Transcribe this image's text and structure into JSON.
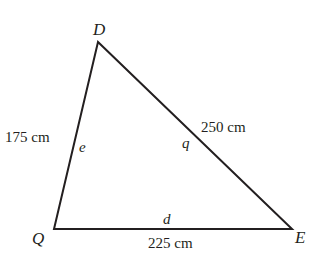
{
  "diagram": {
    "type": "triangle",
    "stroke_color": "#231f20",
    "vertices": {
      "D": {
        "label": "D",
        "x": 98,
        "y": 42
      },
      "Q": {
        "label": "Q",
        "x": 54,
        "y": 229
      },
      "E": {
        "label": "E",
        "x": 292,
        "y": 229
      }
    },
    "sides": {
      "QD": {
        "length_label": "175 cm",
        "variable": "e"
      },
      "DE": {
        "length_label": "250 cm",
        "variable": "q"
      },
      "QE": {
        "length_label": "225 cm",
        "variable": "d"
      }
    }
  }
}
